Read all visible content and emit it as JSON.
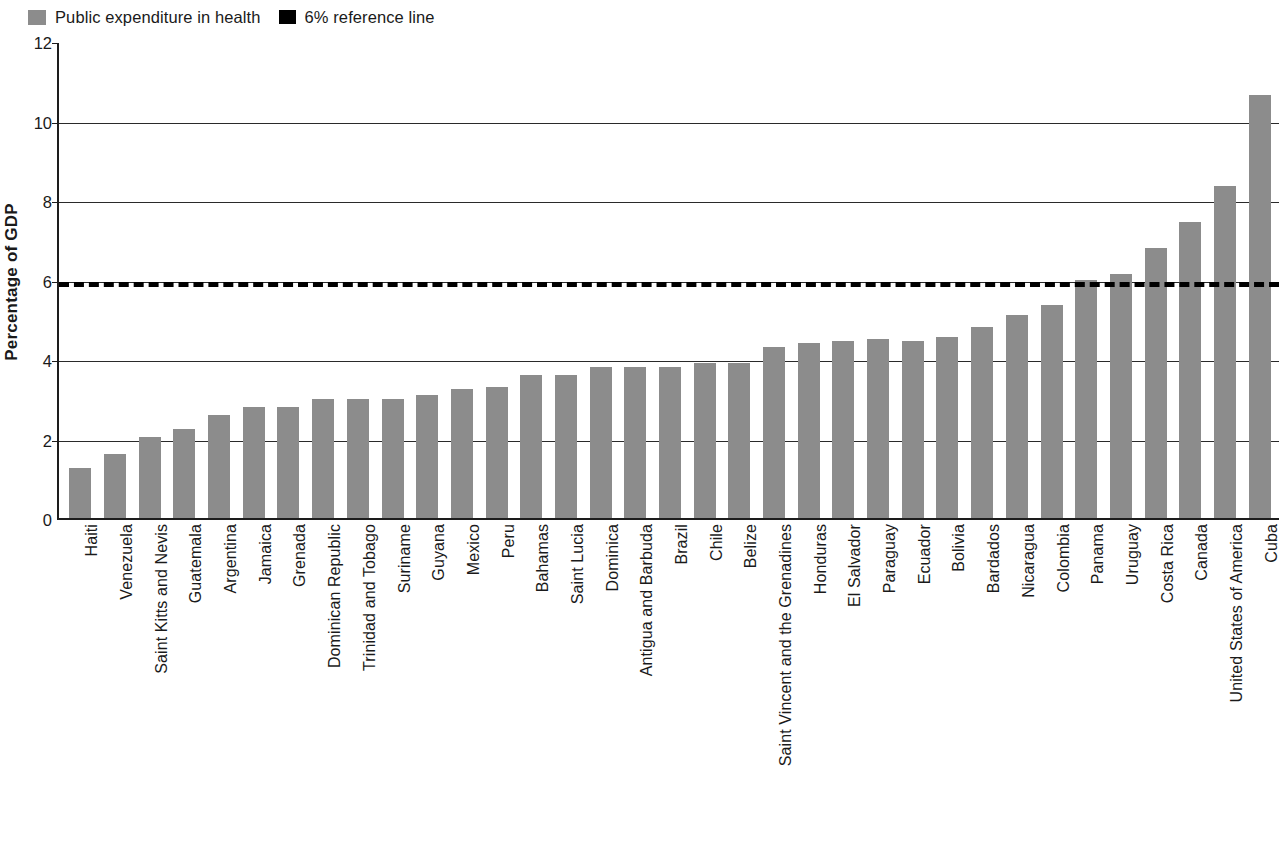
{
  "legend": {
    "entries": [
      {
        "label": "Public expenditure in health",
        "icon": "square-swatch",
        "color": "#8c8c8c"
      },
      {
        "label": "6% reference line",
        "icon": "square-swatch",
        "color": "#000000"
      }
    ]
  },
  "axes": {
    "y_title": "Percentage of GDP",
    "y_ticks": [
      "0",
      "2",
      "4",
      "6",
      "8",
      "10",
      "12"
    ]
  },
  "chart_data": {
    "type": "bar",
    "title": "",
    "xlabel": "",
    "ylabel": "Percentage of GDP",
    "ylim": [
      0,
      12
    ],
    "ytick_step": 2,
    "grid": true,
    "legend_position": "top-left",
    "bar_color": "#8c8c8c",
    "reference_line": {
      "value": 6,
      "label": "6% reference line",
      "style": "dashed",
      "color": "#000000"
    },
    "categories": [
      "Haiti",
      "Venezuela",
      "Saint Kitts and Nevis",
      "Guatemala",
      "Argentina",
      "Jamaica",
      "Grenada",
      "Dominican Republic",
      "Trinidad and Tobago",
      "Suriname",
      "Guyana",
      "Mexico",
      "Peru",
      "Bahamas",
      "Saint Lucia",
      "Dominica",
      "Antigua and Barbuda",
      "Brazil",
      "Chile",
      "Belize",
      "Saint Vincent and the Grenadines",
      "Honduras",
      "El Salvador",
      "Paraguay",
      "Ecuador",
      "Bolivia",
      "Bardados",
      "Nicaragua",
      "Colombia",
      "Panama",
      "Uruguay",
      "Costa Rica",
      "Canada",
      "United States of America",
      "Cuba"
    ],
    "values": [
      1.25,
      1.6,
      2.05,
      2.25,
      2.6,
      2.8,
      2.8,
      3.0,
      3.0,
      3.0,
      3.1,
      3.25,
      3.3,
      3.6,
      3.6,
      3.8,
      3.8,
      3.8,
      3.9,
      3.9,
      4.3,
      4.4,
      4.45,
      4.5,
      4.45,
      4.55,
      4.8,
      5.1,
      5.35,
      6.0,
      6.15,
      6.8,
      7.45,
      8.35,
      10.65
    ],
    "series": [
      {
        "name": "Public expenditure in health",
        "values": [
          1.25,
          1.6,
          2.05,
          2.25,
          2.6,
          2.8,
          2.8,
          3.0,
          3.0,
          3.0,
          3.1,
          3.25,
          3.3,
          3.6,
          3.6,
          3.8,
          3.8,
          3.8,
          3.9,
          3.9,
          4.3,
          4.4,
          4.45,
          4.5,
          4.45,
          4.55,
          4.8,
          5.1,
          5.35,
          6.0,
          6.15,
          6.8,
          7.45,
          8.35,
          10.65
        ]
      }
    ]
  }
}
